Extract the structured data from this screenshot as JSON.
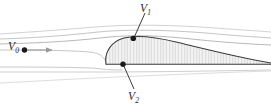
{
  "figure": {
    "kind": "airfoil-streamline-diagram",
    "width": 271,
    "height": 108,
    "background_color": "#ffffff"
  },
  "labels": {
    "freestream": {
      "symbol": "V",
      "subscript": "0",
      "full": "V0"
    },
    "upper_point": {
      "symbol": "V",
      "subscript": "1",
      "full": "V1"
    },
    "lower_point": {
      "symbol": "V",
      "subscript": "2",
      "full": "V2"
    }
  },
  "colors": {
    "outline": "#3a3a3a",
    "streamline": "#b9b9b9",
    "streamline_faint": "#d2d2d2",
    "body_fill": "#eeeeee",
    "hatch": "#cfcfcf",
    "marker": "#1a1a1a",
    "leader": "#333333",
    "arrow": "#9a9a9a",
    "text": "#2a2a2a"
  },
  "geometry": {
    "airfoil": {
      "leading_edge_x": 105,
      "trailing_edge_x": 271,
      "chord_line_y": 65,
      "max_thickness_y": 37,
      "upper_path": "M 106 64 C 104 52, 112 41, 124 38 C 136 35, 152 36, 176 42 C 205 49, 240 58, 271 63",
      "lower_path": "M 106 64 L 271 64",
      "nose_path": "M 106 64 C 103 56, 106 45, 116 40"
    },
    "markers": [
      {
        "name": "upper-stagnation-point",
        "x": 133,
        "y": 38.5,
        "r": 2.6
      },
      {
        "name": "lower-stagnation-point",
        "x": 123,
        "y": 64,
        "r": 2.6
      },
      {
        "name": "freestream-point",
        "x": 25,
        "y": 50,
        "r": 2.6
      }
    ],
    "leaders": [
      {
        "name": "v1-leader",
        "x1": 145,
        "y1": 13,
        "x2": 134.5,
        "y2": 36.5
      },
      {
        "name": "v2-leader",
        "x1": 134,
        "y1": 89,
        "x2": 124,
        "y2": 66
      }
    ],
    "freestream_arrow": {
      "x1": 26,
      "y1": 50,
      "x2": 54,
      "y2": 50
    },
    "streamlines": [
      {
        "name": "streamline-top-1",
        "d": "M 0 34 C 30 32, 60 30, 95 27 C 130 24, 175 25, 215 28 C 242 30, 260 31, 271 32",
        "width": 0.85,
        "color": "#c9c9c9"
      },
      {
        "name": "streamline-top-2",
        "d": "M 0 39 C 32 38, 62 36, 98 32 C 128 29, 168 30, 206 33 C 238 36, 258 37, 271 38",
        "width": 0.9,
        "color": "#bdbdbd"
      },
      {
        "name": "streamline-upper-3",
        "d": "M 0 44 C 34 43, 64 42, 100 38 C 124 35, 150 35, 182 38 C 218 42, 248 44, 271 45",
        "width": 0.95,
        "color": "#b4b4b4"
      },
      {
        "name": "streamline-stag-upper",
        "d": "M 0 50 C 30 50, 62 50, 90 52 C 100 53, 104 57, 106 62",
        "width": 0.9,
        "color": "#c0c0c0"
      },
      {
        "name": "streamline-lower-1",
        "d": "M 0 67 C 30 67, 62 67, 92 68 C 102 69, 110 70, 122 70",
        "width": 0.9,
        "color": "#c4c4c4"
      },
      {
        "name": "streamline-lower-2",
        "d": "M 0 72 C 36 72, 70 72, 104 72 C 150 72, 210 71, 271 70",
        "width": 0.9,
        "color": "#cacaca"
      },
      {
        "name": "streamline-lower-3",
        "d": "M 0 83 C 40 81, 90 78, 140 76 C 190 74, 235 72, 271 71",
        "width": 0.85,
        "color": "#d6d6d6"
      }
    ]
  }
}
